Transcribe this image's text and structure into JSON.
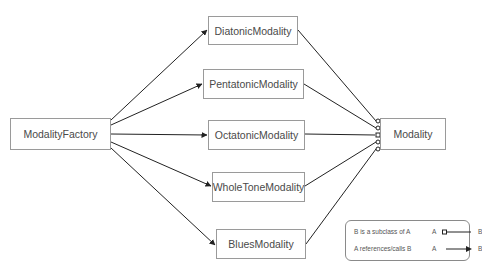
{
  "diagram": {
    "factory": {
      "label": "ModalityFactory"
    },
    "products": [
      {
        "label": "DiatonicModality"
      },
      {
        "label": "PentatonicModality"
      },
      {
        "label": "OctatonicModality"
      },
      {
        "label": "WholeToneModality"
      },
      {
        "label": "BluesModality"
      }
    ],
    "base": {
      "label": "Modality"
    },
    "edges": {
      "references": [
        {
          "from": "ModalityFactory",
          "to": "DiatonicModality"
        },
        {
          "from": "ModalityFactory",
          "to": "PentatonicModality"
        },
        {
          "from": "ModalityFactory",
          "to": "OctatonicModality"
        },
        {
          "from": "ModalityFactory",
          "to": "WholeToneModality"
        },
        {
          "from": "ModalityFactory",
          "to": "BluesModality"
        }
      ],
      "subclass": [
        {
          "from": "DiatonicModality",
          "to": "Modality"
        },
        {
          "from": "PentatonicModality",
          "to": "Modality"
        },
        {
          "from": "OctatonicModality",
          "to": "Modality"
        },
        {
          "from": "WholeToneModality",
          "to": "Modality"
        },
        {
          "from": "BluesModality",
          "to": "Modality"
        }
      ]
    },
    "legend": {
      "subclass": {
        "desc": "B is a subclass of A",
        "a": "A",
        "b": "B"
      },
      "references": {
        "desc": "A references/calls B",
        "a": "A",
        "b": "B"
      }
    },
    "colors": {
      "line": "#222222",
      "border": "#9a9a9a",
      "text": "#4a4a4a"
    }
  }
}
